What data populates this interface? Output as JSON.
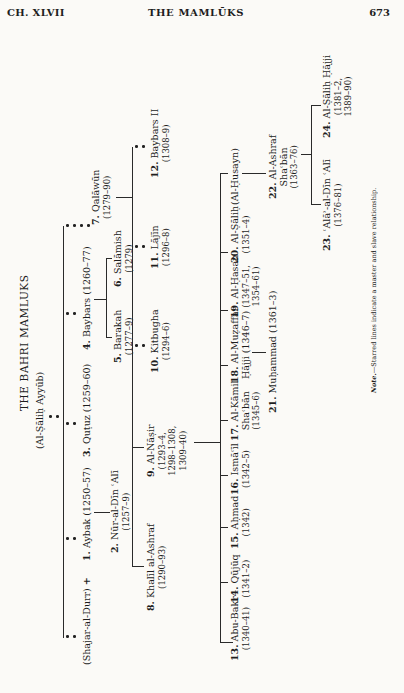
{
  "page_header": {
    "chapter": "CH. XLVII",
    "running_title": "THE MAMLŪKS",
    "page_number": "673"
  },
  "chart": {
    "title": "THE BAHRI MAMLUKS",
    "root": "(Al-Ṣāliḥ Ayyūb)",
    "orientation": "rotated 90° counter-clockwise",
    "rulers": {
      "shajar": {
        "name": "(Shajar-al-Durr)",
        "joiner": "+"
      },
      "r1": {
        "num": "1.",
        "name": "Aybak",
        "dates": "(1250–57)"
      },
      "r2": {
        "num": "2.",
        "name": "Nūr-al-Dīn ʿAlī",
        "dates": "(1257–9)"
      },
      "r3": {
        "num": "3.",
        "name": "Quṭuz",
        "dates": "(1259–60)"
      },
      "r4": {
        "num": "4.",
        "name": "Baybars",
        "dates": "(1260–77)"
      },
      "r5": {
        "num": "5.",
        "name": "Barakah",
        "dates": "(1277–9)"
      },
      "r6": {
        "num": "6.",
        "name": "Salāmish",
        "dates": "(1279)"
      },
      "r7": {
        "num": "7.",
        "name": "Qalāwūn",
        "dates": "(1279–90)"
      },
      "r8": {
        "num": "8.",
        "name": "Khalīl al-Ashraf",
        "dates": "(1290–93)"
      },
      "r9": {
        "num": "9.",
        "name": "Al-Nāṣir",
        "dates1": "(1293–4,",
        "dates2": "1298–1308,",
        "dates3": "1309–40)"
      },
      "r10": {
        "num": "10.",
        "name": "Kitbugha",
        "dates": "(1294–6)"
      },
      "r11": {
        "num": "11.",
        "name": "Lājīn",
        "dates": "(1296–8)"
      },
      "r12": {
        "num": "12.",
        "name": "Baybars II",
        "dates": "(1308–9)"
      },
      "r13": {
        "num": "13.",
        "name": "Abu-Bakr",
        "dates": "(1340–41)"
      },
      "r14": {
        "num": "14.",
        "name": "Qūjūq",
        "dates": "(1341–2)"
      },
      "r15": {
        "num": "15.",
        "name": "Aḥmad",
        "dates": "(1342)"
      },
      "r16": {
        "num": "16.",
        "name": "Ismāʿīl",
        "dates": "(1342–5)"
      },
      "r17": {
        "num": "17.",
        "name": "Al-Kāmil",
        "name2": "Shaʿbān",
        "dates": "(1345–6)"
      },
      "r18": {
        "num": "18.",
        "name": "Al-Muẓaffar",
        "name2": "Ḥājji (1346–7)"
      },
      "r19": {
        "num": "19.",
        "name": "Al-Ḥasan",
        "dates1": "(1347–51,",
        "dates2": "1354–61)"
      },
      "r20": {
        "num": "20.",
        "name": "Al-Ṣāliḥ",
        "dates": "(1351–4)"
      },
      "husayn": {
        "name": "(Al-Ḥusayn)"
      },
      "r21": {
        "num": "21.",
        "name": "Muḥammad (1361–3)"
      },
      "r22": {
        "num": "22.",
        "name": "Al-Ashraf",
        "name2": "Shaʿbān",
        "dates": "(1363–76)"
      },
      "r23": {
        "num": "23.",
        "name": "ʿAlāʾ-al-Dīn ʿAlī",
        "dates": "(1376–81)"
      },
      "r24": {
        "num": "24.",
        "name": "Al-Ṣāliḥ Ḥājji",
        "dates1": "(1381–2,",
        "dates2": "1389–90)"
      }
    },
    "note_label": "Note.",
    "note_text": "—Starred lines indicate a master and slave relationship."
  }
}
